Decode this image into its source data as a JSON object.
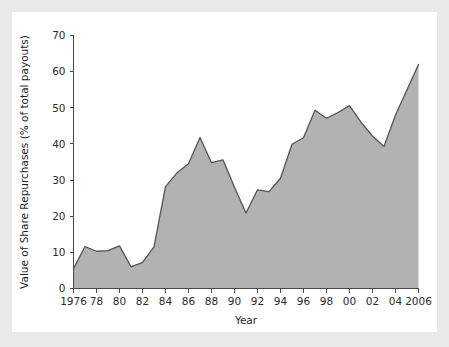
{
  "figure": {
    "background_color": "#e9e9e9",
    "card_color": "#ffffff",
    "area_fill_color": "#b2b2b2",
    "line_color": "#555555",
    "axis_color": "#4a4a4a"
  },
  "chart_data": {
    "type": "area",
    "title": "",
    "xlabel": "Year",
    "ylabel": "Value of Share Repurchases (% of total payouts)",
    "xlim": [
      1976,
      2006
    ],
    "ylim": [
      0,
      70
    ],
    "grid": false,
    "legend": "none",
    "ytick_labels": [
      "0",
      "10",
      "20",
      "30",
      "40",
      "50",
      "60",
      "70"
    ],
    "yticks": [
      0,
      10,
      20,
      30,
      40,
      50,
      60,
      70
    ],
    "xtick_labels": [
      "1976",
      "78",
      "80",
      "82",
      "84",
      "86",
      "88",
      "90",
      "92",
      "94",
      "96",
      "98",
      "00",
      "02",
      "04",
      "2006"
    ],
    "xticks": [
      1976,
      1978,
      1980,
      1982,
      1984,
      1986,
      1988,
      1990,
      1992,
      1994,
      1996,
      1998,
      2000,
      2002,
      2004,
      2006
    ],
    "x": [
      1976,
      1977,
      1978,
      1979,
      1980,
      1981,
      1982,
      1983,
      1984,
      1985,
      1986,
      1987,
      1988,
      1989,
      1990,
      1991,
      1992,
      1993,
      1994,
      1995,
      1996,
      1997,
      1998,
      1999,
      2000,
      2001,
      2002,
      2003,
      2004,
      2005,
      2006
    ],
    "values": [
      5.5,
      11.6,
      10.3,
      10.5,
      11.8,
      6.0,
      7.2,
      11.5,
      28.2,
      32.0,
      34.5,
      41.8,
      34.8,
      35.6,
      28.0,
      20.9,
      27.3,
      26.8,
      30.5,
      39.9,
      41.7,
      49.3,
      47.1,
      48.7,
      50.6,
      46.0,
      42.2,
      39.3,
      48.0,
      55.0,
      62.0
    ]
  }
}
